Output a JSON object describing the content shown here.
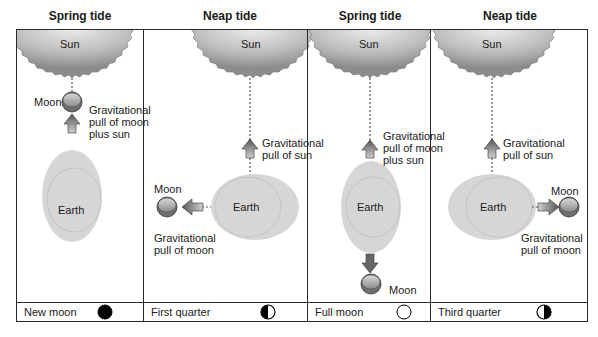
{
  "panels": [
    {
      "heading": "Spring tide",
      "sun_label": "Sun",
      "earth_label": "Earth",
      "moon_label": "Moon",
      "pull_label_lines": [
        "Gravitational",
        "pull of moon",
        "plus sun"
      ],
      "phase_label": "New moon",
      "phase_icon": "new-moon-icon"
    },
    {
      "heading": "Neap tide",
      "sun_label": "Sun",
      "earth_label": "Earth",
      "moon_label": "Moon",
      "sun_pull_label_lines": [
        "Gravitational",
        "pull of sun"
      ],
      "moon_pull_label_lines": [
        "Gravitational",
        "pull of moon"
      ],
      "phase_label": "First quarter",
      "phase_icon": "first-quarter-icon"
    },
    {
      "heading": "Spring tide",
      "sun_label": "Sun",
      "earth_label": "Earth",
      "moon_label": "Moon",
      "pull_label_lines": [
        "Gravitational",
        "pull of moon",
        "plus sun"
      ],
      "phase_label": "Full moon",
      "phase_icon": "full-moon-icon"
    },
    {
      "heading": "Neap tide",
      "sun_label": "Sun",
      "earth_label": "Earth",
      "moon_label": "Moon",
      "sun_pull_label_lines": [
        "Gravitational",
        "pull of sun"
      ],
      "moon_pull_label_lines": [
        "Gravitational",
        "pull of moon"
      ],
      "phase_label": "Third quarter",
      "phase_icon": "third-quarter-icon"
    }
  ],
  "colors": {
    "earth": "#d4d4d4",
    "sun_dark": "#8a8a8a",
    "sun_light": "#e6e6e6",
    "line": "#2a2a2a"
  }
}
